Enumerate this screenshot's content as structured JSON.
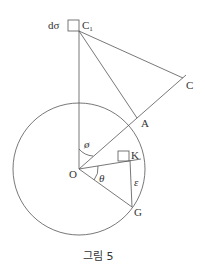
{
  "figure": {
    "caption": "그림 5",
    "labels": {
      "d_sigma": "dσ",
      "c1": "C",
      "c1_sub": "1",
      "c": "C",
      "a": "A",
      "k": "K",
      "o": "O",
      "g": "G",
      "phi": "ø",
      "theta": "θ",
      "epsilon": "ε"
    },
    "colors": {
      "line": "#555555",
      "text": "#333333",
      "background": "#ffffff"
    }
  }
}
